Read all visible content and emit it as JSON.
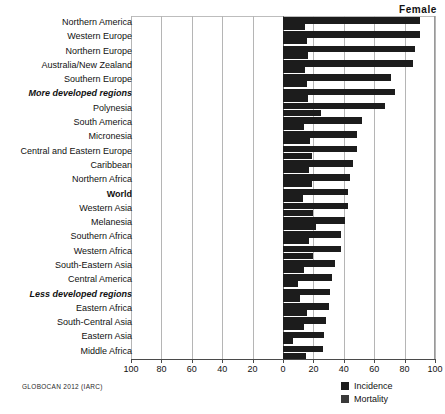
{
  "chart_data": {
    "type": "bar",
    "orientation": "horizontal",
    "title": "Female",
    "xlabel": "",
    "ylabel": "",
    "source": "GLOBOCAN 2012 (IARC)",
    "xlim": [
      -100,
      100
    ],
    "xticks": [
      -100,
      -80,
      -60,
      -40,
      -20,
      0,
      20,
      40,
      60,
      80,
      100
    ],
    "xtick_labels": [
      "100",
      "80",
      "60",
      "40",
      "20",
      "0",
      "20",
      "40",
      "60",
      "80",
      "100"
    ],
    "grid": true,
    "legend_position": "bottom-right",
    "legend": [
      "Incidence",
      "Mortality"
    ],
    "categories": [
      "Northern America",
      "Western Europe",
      "Northern Europe",
      "Australia/New Zealand",
      "Southern Europe",
      "More developed regions",
      "Polynesia",
      "South America",
      "Micronesia",
      "Central and Eastern Europe",
      "Caribbean",
      "Northern Africa",
      "World",
      "Western Asia",
      "Melanesia",
      "Southern Africa",
      "Western Africa",
      "South-Eastern Asia",
      "Central America",
      "Less developed regions",
      "Eastern Africa",
      "South-Central Asia",
      "Eastern Asia",
      "Middle Africa"
    ],
    "emphasis_categories": [
      "More developed regions",
      "World",
      "Less developed regions"
    ],
    "series": [
      {
        "name": "Incidence",
        "values": [
          89.9,
          90.0,
          87.0,
          85.5,
          71.0,
          74.0,
          67.0,
          52.0,
          48.5,
          48.5,
          46.0,
          44.0,
          43.0,
          42.5,
          41.0,
          38.0,
          38.0,
          34.0,
          32.5,
          31.0,
          30.5,
          28.0,
          27.0,
          26.5
        ]
      },
      {
        "name": "Mortality",
        "values": [
          14.8,
          16.0,
          16.5,
          14.5,
          16.0,
          16.5,
          25.0,
          14.0,
          18.0,
          19.0,
          17.0,
          19.0,
          12.9,
          20.0,
          22.0,
          17.0,
          20.0,
          14.0,
          10.0,
          11.0,
          16.0,
          13.5,
          6.5,
          15.0
        ]
      }
    ]
  }
}
